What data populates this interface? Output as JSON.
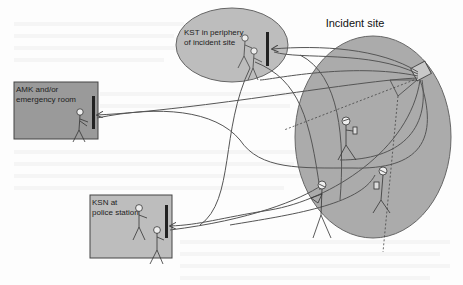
{
  "diagram": {
    "title": "Incident site",
    "nodes": [
      {
        "id": "amk",
        "label_line1": "AMK and/or",
        "label_line2": "emergency room",
        "shape": "rectangle",
        "fill": "#9a9a9a"
      },
      {
        "id": "kst",
        "label_line1": "KST in periphery",
        "label_line2": "of incident site",
        "shape": "ellipse",
        "fill": "#bdbdbd"
      },
      {
        "id": "ksn",
        "label_line1": "KSN at",
        "label_line2": "police station",
        "shape": "rectangle",
        "fill": "#bdbdbd"
      },
      {
        "id": "incident",
        "label_line1": "Incident site",
        "shape": "ellipse",
        "fill": "#ababab"
      }
    ],
    "edges": [
      {
        "from": "incident",
        "to": "kst",
        "style": "arrow"
      },
      {
        "from": "incident",
        "to": "amk",
        "style": "arrow"
      },
      {
        "from": "incident",
        "to": "ksn",
        "style": "arrow"
      }
    ],
    "colors": {
      "background": "#fdfdfd",
      "stroke": "#555555",
      "dark": "#333333"
    }
  }
}
